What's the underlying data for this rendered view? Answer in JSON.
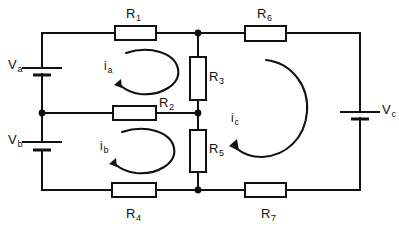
{
  "diagram": {
    "type": "electrical-schematic",
    "background_color": "#ffffff",
    "line_color": "#111111"
  },
  "resistors": [
    {
      "id": "R1",
      "name": "R",
      "sub": "1",
      "orientation": "horizontal",
      "label_position": "above"
    },
    {
      "id": "R2",
      "name": "R",
      "sub": "2",
      "orientation": "horizontal",
      "label_position": "right"
    },
    {
      "id": "R3",
      "name": "R",
      "sub": "3",
      "orientation": "vertical",
      "label_position": "right"
    },
    {
      "id": "R4",
      "name": "R",
      "sub": "4",
      "orientation": "horizontal",
      "label_position": "below"
    },
    {
      "id": "R5",
      "name": "R",
      "sub": "5",
      "orientation": "vertical",
      "label_position": "right"
    },
    {
      "id": "R6",
      "name": "R",
      "sub": "6",
      "orientation": "horizontal",
      "label_position": "above"
    },
    {
      "id": "R7",
      "name": "R",
      "sub": "7",
      "orientation": "horizontal",
      "label_position": "below"
    }
  ],
  "sources": [
    {
      "id": "Va",
      "name": "V",
      "sub": "a",
      "orientation": "vertical",
      "label_position": "left"
    },
    {
      "id": "Vb",
      "name": "V",
      "sub": "b",
      "orientation": "vertical",
      "label_position": "left"
    },
    {
      "id": "Vc",
      "name": "V",
      "sub": "c",
      "orientation": "vertical",
      "label_position": "right"
    }
  ],
  "mesh_currents": [
    {
      "id": "ia",
      "name": "i",
      "sub": "a",
      "direction": "counterclockwise"
    },
    {
      "id": "ib",
      "name": "i",
      "sub": "b",
      "direction": "counterclockwise"
    },
    {
      "id": "ic",
      "name": "i",
      "sub": "c",
      "direction": "counterclockwise"
    }
  ]
}
